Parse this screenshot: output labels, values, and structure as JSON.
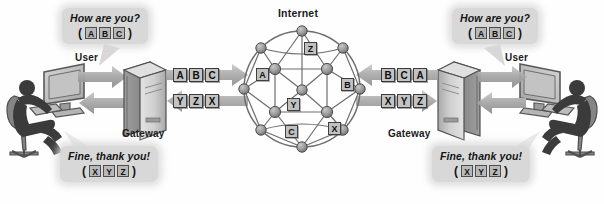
{
  "diagram": {
    "title": "Internet",
    "background_color": "#ffffff",
    "accent_color": "#8c8c8c",
    "tile_color": "#c0c0c0",
    "line_color": "#595959"
  },
  "left_side": {
    "user_label": "User",
    "gateway_label": "Gateway",
    "outgoing_bubble": {
      "text": "How are you?",
      "open_paren": "(",
      "close_paren": ")",
      "letters": [
        "A",
        "B",
        "C"
      ]
    },
    "incoming_bubble": {
      "text": "Fine, thank you!",
      "open_paren": "(",
      "close_paren": ")",
      "letters": [
        "X",
        "Y",
        "Z"
      ]
    },
    "outgoing_packets": [
      "A",
      "B",
      "C"
    ],
    "incoming_packets": [
      "Y",
      "Z",
      "X"
    ]
  },
  "right_side": {
    "user_label": "User",
    "gateway_label": "Gateway",
    "incoming_bubble": {
      "text": "How are you?",
      "open_paren": "(",
      "close_paren": ")",
      "letters": [
        "A",
        "B",
        "C"
      ]
    },
    "outgoing_bubble": {
      "text": "Fine, thank you!",
      "open_paren": "(",
      "close_paren": ")",
      "letters": [
        "X",
        "Y",
        "Z"
      ]
    },
    "incoming_packets": [
      "B",
      "C",
      "A"
    ],
    "outgoing_packets": [
      "X",
      "Y",
      "Z"
    ]
  },
  "internet_cloud": {
    "label": "Internet",
    "packet_tags": [
      {
        "letter": "Z",
        "x": 304,
        "y": 42
      },
      {
        "letter": "A",
        "x": 256,
        "y": 68
      },
      {
        "letter": "B",
        "x": 341,
        "y": 78
      },
      {
        "letter": "Y",
        "x": 287,
        "y": 98
      },
      {
        "letter": "C",
        "x": 285,
        "y": 125
      },
      {
        "letter": "X",
        "x": 328,
        "y": 122
      }
    ]
  }
}
